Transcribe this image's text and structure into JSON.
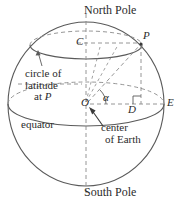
{
  "figure": {
    "background_color": "#ffffff",
    "stroke_color": "#555555",
    "text_color": "#2b2b2b",
    "labels": {
      "north_pole": "North Pole",
      "south_pole": "South Pole",
      "point_p": "P",
      "point_c": "C",
      "point_o": "O",
      "point_d": "D",
      "point_e": "E",
      "angle_alpha": "α",
      "circle_of_latitude_line1": "circle of",
      "circle_of_latitude_line2": "latitude",
      "circle_of_latitude_line3_prefix": "at ",
      "circle_of_latitude_line3_point": "P",
      "equator": "equator",
      "center_line1": "center",
      "center_line2": "of Earth"
    },
    "geometry": {
      "sphere_center_x": 86,
      "sphere_center_y": 104,
      "sphere_radius_x": 78,
      "sphere_radius_y": 82,
      "equator_ellipse_ry": 22,
      "latitude_circle_center_y": 45,
      "latitude_circle_rx": 56,
      "latitude_circle_ry": 14,
      "point_p_x": 141,
      "point_p_y": 43,
      "point_c_x": 86,
      "point_c_y": 43,
      "point_d_x": 141,
      "point_d_y": 104,
      "point_e_x": 164,
      "point_e_y": 104,
      "point_o_x": 86,
      "point_o_y": 104,
      "right_angle_marker_size": 8,
      "alpha_arc_radius": 20
    }
  }
}
